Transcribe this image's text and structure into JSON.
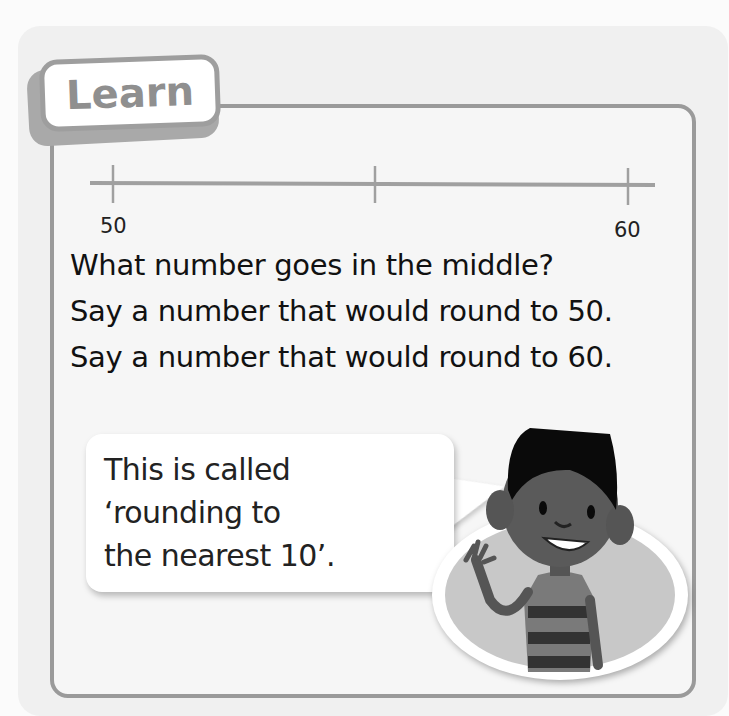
{
  "section": {
    "tab_label": "Learn"
  },
  "number_line": {
    "start_label": "50",
    "end_label": "60",
    "ticks": 3,
    "middle_label": ""
  },
  "questions": [
    "What number goes in the middle?",
    "Say a number that would round to 50.",
    "Say a number that would round to 60."
  ],
  "speech_bubble": {
    "text": "This is called\n‘rounding to\nthe nearest 10’."
  },
  "character": {
    "description": "smiling boy waving, striped shirt"
  },
  "colors": {
    "border": "#9a9a9a",
    "panel_bg": "#f0f0f0",
    "text": "#111111"
  }
}
